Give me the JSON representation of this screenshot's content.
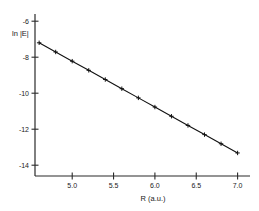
{
  "chart_data": {
    "type": "line",
    "title": "",
    "xlabel": "R (a.u.)",
    "ylabel": "ln |E|",
    "xlim": [
      4.55,
      7.15
    ],
    "ylim": [
      -14.6,
      -5.6
    ],
    "grid": false,
    "legend": null,
    "marker_style": "plus",
    "line_color": "#111111",
    "xticks": [
      5.0,
      5.5,
      6.0,
      6.5,
      7.0
    ],
    "xtick_labels": [
      "5.0",
      "5.5",
      "6.0",
      "6.5",
      "7.0"
    ],
    "yticks": [
      -6,
      -8,
      -10,
      -12,
      -14
    ],
    "ytick_labels": [
      "-6",
      "-8",
      "-10",
      "-12",
      "-14"
    ],
    "series": [
      {
        "name": "ln |E| vs R",
        "x": [
          4.6,
          4.8,
          5.0,
          5.2,
          5.4,
          5.6,
          5.8,
          6.0,
          6.2,
          6.4,
          6.6,
          6.8,
          7.0
        ],
        "y": [
          -7.2,
          -7.71,
          -8.22,
          -8.73,
          -9.24,
          -9.75,
          -10.26,
          -10.77,
          -11.28,
          -11.79,
          -12.3,
          -12.81,
          -13.32
        ]
      }
    ]
  },
  "axis": {
    "x_title": "R (a.u.)",
    "y_title": "ln |E|"
  }
}
